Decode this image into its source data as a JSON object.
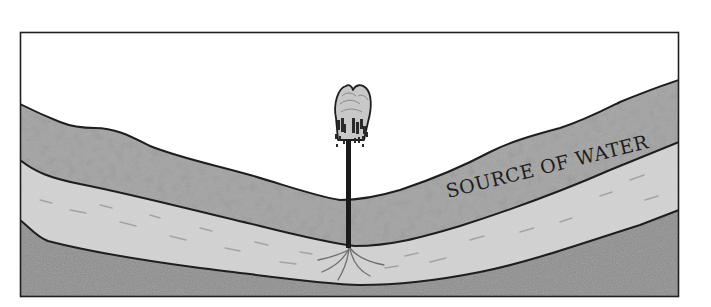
{
  "diagram": {
    "type": "geological-cross-section",
    "frame": {
      "x": 20,
      "y": 32,
      "width": 659,
      "height": 265,
      "stroke": "#1e1e1e"
    },
    "colors": {
      "sky": "#ffffff",
      "upper_layer": "#9a9a9a",
      "aquifer": "#cdcdcd",
      "bedrock": "#8a8a8a",
      "outline": "#1e1e1e",
      "fountain_plume": "#c4c4c4",
      "pipe": "#1a1a1a"
    },
    "layers": [
      {
        "name": "upper-rock-layer",
        "label": ""
      },
      {
        "name": "aquifer-layer",
        "label": "SOURCE OF WATER"
      },
      {
        "name": "bedrock-layer",
        "label": ""
      }
    ],
    "aquifer_label": {
      "text": "SOURCE OF WATER",
      "x": 448,
      "y": 198,
      "rotation": -14
    },
    "features": [
      {
        "name": "fountain",
        "description": "water gushing up from a pipe at valley bottom"
      },
      {
        "name": "well-pipe",
        "description": "vertical pipe reaching into the water-bearing layer"
      }
    ]
  }
}
